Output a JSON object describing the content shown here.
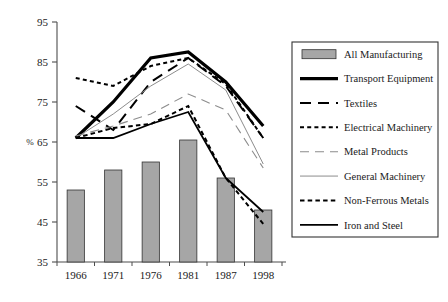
{
  "chart_data": {
    "type": "line",
    "title": "",
    "subtitle": "",
    "xlabel": "",
    "ylabel": "%",
    "categories": [
      "1966",
      "1971",
      "1976",
      "1981",
      "1987",
      "1998"
    ],
    "ylim": [
      35,
      95
    ],
    "yticks": [
      35,
      45,
      55,
      65,
      75,
      85,
      95
    ],
    "ytick_labels": [
      "35",
      "45",
      "55",
      "65",
      "75",
      "85",
      "95"
    ],
    "grid": false,
    "legend_position": "right",
    "bar_series": {
      "name": "All Manufacturing",
      "type": "bar",
      "values": [
        53,
        58,
        60,
        65.5,
        56,
        48
      ],
      "color": "#a6a6a6",
      "edge_color": "#333333"
    },
    "series": [
      {
        "name": "Transport Equipment",
        "values": [
          66,
          75,
          86,
          87.5,
          80,
          69
        ],
        "style": "solid",
        "width": 3.2,
        "color": "#000000"
      },
      {
        "name": "Textiles",
        "values": [
          74,
          68,
          80,
          86,
          79,
          66
        ],
        "style": "dashed",
        "width": 2.0,
        "color": "#000000"
      },
      {
        "name": "Electrical Machinery",
        "values": [
          81,
          79,
          84,
          86,
          79.5,
          66
        ],
        "style": "dotted",
        "width": 2.0,
        "color": "#000000"
      },
      {
        "name": "Metal Products",
        "values": [
          66.5,
          69,
          72,
          77,
          73,
          58.5
        ],
        "style": "dashed-light",
        "width": 1.1,
        "color": "#8c8c8c"
      },
      {
        "name": "General Machinery",
        "values": [
          66,
          72,
          79,
          84.5,
          78,
          59.5
        ],
        "style": "solid-thin",
        "width": 1.0,
        "color": "#8c8c8c"
      },
      {
        "name": "Non-Ferrous Metals",
        "values": [
          66,
          68.5,
          69.5,
          74,
          56,
          44.5
        ],
        "style": "fine-dashed",
        "width": 2.0,
        "color": "#000000"
      },
      {
        "name": "Iron and Steel",
        "values": [
          66,
          66,
          69.5,
          72.5,
          56,
          47.5
        ],
        "style": "solid-medium",
        "width": 1.8,
        "color": "#000000"
      }
    ]
  },
  "legend": {
    "items": [
      {
        "label": "All Manufacturing",
        "swatch": "bar-swatch"
      },
      {
        "label": "Transport Equipment",
        "swatch": "thick-solid-swatch"
      },
      {
        "label": "Textiles",
        "swatch": "dashed-swatch"
      },
      {
        "label": "Electrical Machinery",
        "swatch": "dotted-swatch"
      },
      {
        "label": "Metal Products",
        "swatch": "light-dashed-swatch"
      },
      {
        "label": "General Machinery",
        "swatch": "thin-solid-swatch"
      },
      {
        "label": "Non-Ferrous Metals",
        "swatch": "fine-dashed-swatch"
      },
      {
        "label": "Iron and Steel",
        "swatch": "medium-solid-swatch"
      }
    ]
  },
  "axis": {
    "y_unit": "%"
  }
}
